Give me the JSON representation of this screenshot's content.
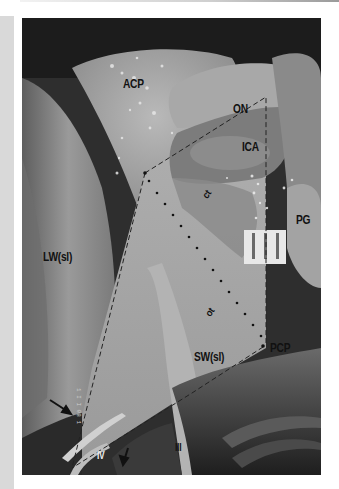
{
  "figure": {
    "labels": {
      "acp": "ACP",
      "on": "ON",
      "ica": "ICA",
      "ct": "ct",
      "pg": "PG",
      "lw": "LW(sl)",
      "ot": "ot",
      "sw": "SW(sl)",
      "pcp": "PCP",
      "iv": "IV",
      "iii": "III"
    },
    "annotations": {
      "dashed_outline": "quadrilateral dashed line connecting ACP tip, ON/ICA region, PCP and inferior apex",
      "dotted_line": "dotted diagonal from ACP tip to PCP",
      "arrows": 2,
      "scale_marker": "white rectangular marker with two vertical bars"
    },
    "colors": {
      "photo_dark": "#2a2a2a",
      "photo_mid": "#8a8a8a",
      "photo_light": "#c8c8c8",
      "label": "#111111"
    }
  }
}
